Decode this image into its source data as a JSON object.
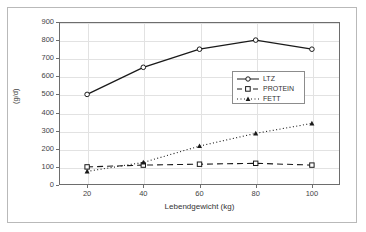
{
  "figure": {
    "xlabel": "Lebendgewicht (kg)",
    "ylabel": "(g/d)"
  },
  "legend": {
    "position": "center",
    "items": [
      {
        "label": "LTZ",
        "style": "solid-circle"
      },
      {
        "label": "PROTEIN",
        "style": "dashed-square"
      },
      {
        "label": "FETT",
        "style": "dotted-triangle"
      }
    ]
  },
  "axes": {
    "y_ticks": [
      "0",
      "100",
      "200",
      "300",
      "400",
      "500",
      "600",
      "700",
      "800",
      "900"
    ],
    "x_ticks": [
      "20",
      "40",
      "60",
      "80",
      "100"
    ]
  },
  "chart_data": {
    "type": "line",
    "title": "",
    "xlabel": "Lebendgewicht (kg)",
    "ylabel": "(g/d)",
    "xlim": [
      10,
      110
    ],
    "ylim": [
      0,
      900
    ],
    "grid": true,
    "legend_position": "center",
    "x": [
      20,
      40,
      60,
      80,
      100
    ],
    "series": [
      {
        "name": "LTZ",
        "values": [
          500,
          650,
          750,
          800,
          750
        ],
        "marker": "open-circle",
        "line": "solid",
        "color": "#1a1a1a"
      },
      {
        "name": "PROTEIN",
        "values": [
          100,
          110,
          115,
          120,
          110
        ],
        "marker": "open-square",
        "line": "dashed",
        "color": "#1a1a1a"
      },
      {
        "name": "FETT",
        "values": [
          75,
          125,
          215,
          285,
          340
        ],
        "marker": "filled-triangle",
        "line": "dotted",
        "color": "#1a1a1a"
      }
    ]
  }
}
